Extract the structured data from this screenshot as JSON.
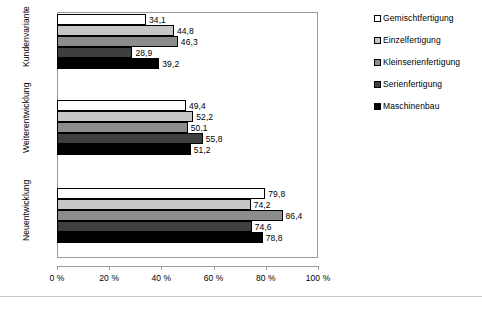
{
  "chart_data": {
    "type": "bar",
    "orientation": "horizontal",
    "title": "",
    "subtitle": "",
    "xlabel": "",
    "ylabel": "",
    "xlim": [
      0,
      100
    ],
    "grid": false,
    "legend_position": "right",
    "categories": [
      "Kundenvariante",
      "Weiterentwicklung",
      "Neuentwicklung"
    ],
    "tick_labels": [
      "0 %",
      "20 %",
      "40 %",
      "60 %",
      "80 %",
      "100 %"
    ],
    "tick_values": [
      0,
      20,
      40,
      60,
      80,
      100
    ],
    "series": [
      {
        "name": "Gemischtfertigung",
        "color": "#ffffff",
        "values": [
          34.1,
          49.4,
          79.8
        ],
        "labels": [
          "34,1",
          "49,4",
          "79,8"
        ]
      },
      {
        "name": "Einzelfertigung",
        "color": "#c6c6c6",
        "values": [
          44.8,
          52.2,
          74.2
        ],
        "labels": [
          "44,8",
          "52,2",
          "74,2"
        ]
      },
      {
        "name": "Kleinserienfertigung",
        "color": "#8c8c8c",
        "values": [
          46.3,
          50.1,
          86.4
        ],
        "labels": [
          "46,3",
          "50,1",
          "86,4"
        ]
      },
      {
        "name": "Serienfertigung",
        "color": "#3f3f3f",
        "values": [
          28.9,
          55.8,
          74.6
        ],
        "labels": [
          "28,9",
          "55,8",
          "74,6"
        ]
      },
      {
        "name": "Maschinenbau",
        "color": "#000000",
        "values": [
          39.2,
          51.2,
          78.8
        ],
        "labels": [
          "39,2",
          "51,2",
          "78,8"
        ]
      }
    ]
  }
}
